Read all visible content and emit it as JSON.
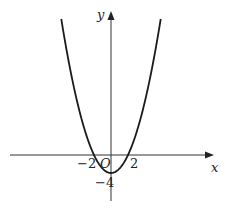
{
  "figure": {
    "function": "y = x^2 - 4",
    "axes": {
      "x_label": "x",
      "y_label": "y",
      "origin_label": "O"
    },
    "tick_labels": {
      "x_neg": "−2",
      "x_pos": "2",
      "y_neg": "−4"
    },
    "colors": {
      "curve": "#1a1a1a",
      "axis": "#333333",
      "background": "#ffffff"
    }
  }
}
